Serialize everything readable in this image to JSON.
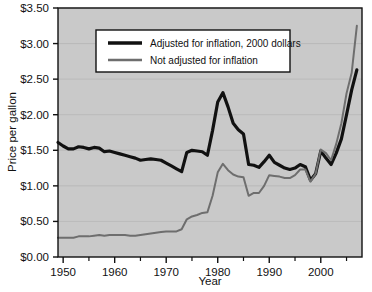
{
  "chart_data": {
    "type": "line",
    "title": "",
    "xlabel": "Year",
    "ylabel": "Price per gallon",
    "xlim": [
      1949,
      2008
    ],
    "ylim": [
      0,
      3.5
    ],
    "grid": true,
    "legend_position": "top-center",
    "x_ticks": [
      1950,
      1960,
      1970,
      1980,
      1990,
      2000
    ],
    "x_tick_labels": [
      "1950",
      "1960",
      "1970",
      "1980",
      "1990",
      "2000"
    ],
    "x_minor_ticks": [
      1955,
      1965,
      1975,
      1985,
      1995,
      2005
    ],
    "y_ticks": [
      0,
      0.5,
      1.0,
      1.5,
      2.0,
      2.5,
      3.0,
      3.5
    ],
    "y_tick_labels": [
      "$0.00",
      "$0.50",
      "$1.00",
      "$1.50",
      "$2.00",
      "$2.50",
      "$3.00",
      "$3.50"
    ],
    "x": [
      1949,
      1950,
      1951,
      1952,
      1953,
      1954,
      1955,
      1956,
      1957,
      1958,
      1959,
      1960,
      1961,
      1962,
      1963,
      1964,
      1965,
      1966,
      1967,
      1968,
      1969,
      1970,
      1971,
      1972,
      1973,
      1974,
      1975,
      1976,
      1977,
      1978,
      1979,
      1980,
      1981,
      1982,
      1983,
      1984,
      1985,
      1986,
      1987,
      1988,
      1989,
      1990,
      1991,
      1992,
      1993,
      1994,
      1995,
      1996,
      1997,
      1998,
      1999,
      2000,
      2001,
      2002,
      2003,
      2004,
      2005,
      2006,
      2007
    ],
    "series": [
      {
        "name": "Adjusted for inflation, 2000 dollars",
        "color": "#111111",
        "width": 3.2,
        "values": [
          1.61,
          1.56,
          1.52,
          1.52,
          1.55,
          1.54,
          1.52,
          1.54,
          1.53,
          1.48,
          1.49,
          1.47,
          1.45,
          1.43,
          1.41,
          1.39,
          1.36,
          1.37,
          1.38,
          1.37,
          1.36,
          1.32,
          1.28,
          1.24,
          1.2,
          1.47,
          1.5,
          1.49,
          1.48,
          1.43,
          1.78,
          2.18,
          2.31,
          2.11,
          1.88,
          1.79,
          1.73,
          1.3,
          1.29,
          1.26,
          1.34,
          1.43,
          1.33,
          1.29,
          1.25,
          1.23,
          1.25,
          1.3,
          1.27,
          1.08,
          1.17,
          1.49,
          1.39,
          1.3,
          1.46,
          1.66,
          2.0,
          2.35,
          2.63
        ]
      },
      {
        "name": "Not adjusted for inflation",
        "color": "#6e6e6e",
        "width": 2.0,
        "values": [
          0.27,
          0.27,
          0.27,
          0.27,
          0.29,
          0.29,
          0.29,
          0.3,
          0.31,
          0.3,
          0.31,
          0.31,
          0.31,
          0.31,
          0.3,
          0.3,
          0.31,
          0.32,
          0.33,
          0.34,
          0.35,
          0.36,
          0.36,
          0.36,
          0.39,
          0.53,
          0.57,
          0.59,
          0.62,
          0.63,
          0.86,
          1.19,
          1.31,
          1.22,
          1.16,
          1.13,
          1.12,
          0.86,
          0.9,
          0.9,
          1.0,
          1.15,
          1.14,
          1.13,
          1.11,
          1.11,
          1.15,
          1.23,
          1.23,
          1.06,
          1.17,
          1.51,
          1.46,
          1.36,
          1.59,
          1.88,
          2.3,
          2.59,
          3.25
        ]
      }
    ]
  },
  "legend": {
    "items": [
      {
        "label": "Adjusted for inflation, 2000 dollars"
      },
      {
        "label": "Not adjusted for inflation"
      }
    ]
  },
  "axes": {
    "x_title": "Year",
    "y_title": "Price per gallon"
  },
  "colors": {
    "plot_background": "#c9c9c9",
    "page_background": "#ffffff",
    "axis": "#111111",
    "gridline": "#b6b6b6",
    "legend_background": "#ffffff",
    "legend_border": "#111111",
    "series_adjusted": "#111111",
    "series_nominal": "#6e6e6e"
  }
}
